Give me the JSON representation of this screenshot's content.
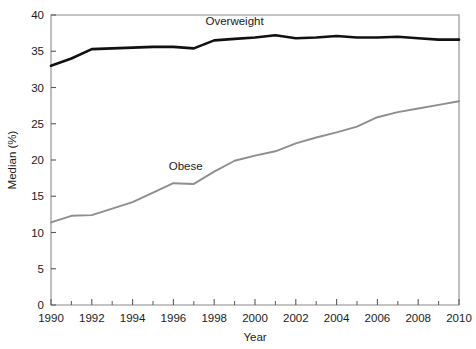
{
  "chart_data": {
    "type": "line",
    "title": "",
    "xlabel": "Year",
    "ylabel": "Median (%)",
    "xlim": [
      1990,
      2010
    ],
    "ylim": [
      0,
      40
    ],
    "grid": false,
    "legend_position": "inline-annotations",
    "x_major_ticks": [
      1990,
      1992,
      1994,
      1996,
      1998,
      2000,
      2002,
      2004,
      2006,
      2008,
      2010
    ],
    "x_minor_ticks": [
      1991,
      1993,
      1995,
      1997,
      1999,
      2001,
      2003,
      2005,
      2007,
      2009
    ],
    "y_major_ticks": [
      0,
      5,
      10,
      15,
      20,
      25,
      30,
      35,
      40
    ],
    "x": [
      1990,
      1991,
      1992,
      1993,
      1994,
      1995,
      1996,
      1997,
      1998,
      1999,
      2000,
      2001,
      2002,
      2003,
      2004,
      2005,
      2006,
      2007,
      2008,
      2009,
      2010
    ],
    "series": [
      {
        "name": "Overweight",
        "color": "#111111",
        "label_x": 1999.0,
        "label_y": 38.6,
        "values": [
          33.0,
          34.0,
          35.3,
          35.4,
          35.5,
          35.6,
          35.6,
          35.4,
          36.5,
          36.7,
          36.9,
          37.2,
          36.8,
          36.9,
          37.1,
          36.9,
          36.9,
          37.0,
          36.8,
          36.6,
          36.6
        ]
      },
      {
        "name": "Obese",
        "color": "#8e8e8e",
        "label_x": 1996.6,
        "label_y": 18.6,
        "values": [
          11.4,
          12.3,
          12.4,
          13.3,
          14.2,
          15.5,
          16.8,
          16.7,
          18.4,
          19.9,
          20.6,
          21.2,
          22.3,
          23.1,
          23.8,
          24.6,
          25.9,
          26.6,
          27.1,
          27.6,
          28.1
        ]
      }
    ]
  },
  "axis": {
    "x_tick_labels": [
      "1990",
      "1992",
      "1994",
      "1996",
      "1998",
      "2000",
      "2002",
      "2004",
      "2006",
      "2008",
      "2010"
    ],
    "y_tick_labels": [
      "0",
      "5",
      "10",
      "15",
      "20",
      "25",
      "30",
      "35",
      "40"
    ],
    "x_title": "Year",
    "y_title": "Median (%)"
  },
  "annotations": {
    "overweight_label": "Overweight",
    "obese_label": "Obese"
  }
}
